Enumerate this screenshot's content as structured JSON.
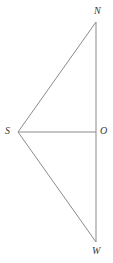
{
  "figure": {
    "background_color": "#ffffff",
    "stroke_color": "#8a8a8a",
    "label_color": "#3a3a3a",
    "stroke_width": 1,
    "width": 113,
    "height": 263,
    "points": {
      "N": {
        "label": "N",
        "x": 96,
        "y": 22
      },
      "S": {
        "label": "S",
        "x": 18,
        "y": 132
      },
      "O": {
        "label": "O",
        "x": 96,
        "y": 132
      },
      "W": {
        "label": "W",
        "x": 96,
        "y": 242
      }
    },
    "segments": [
      {
        "name": "segment-S-N",
        "from": "S",
        "to": "N"
      },
      {
        "name": "segment-N-O",
        "from": "N",
        "to": "O"
      },
      {
        "name": "segment-O-W",
        "from": "O",
        "to": "W"
      },
      {
        "name": "segment-W-S",
        "from": "W",
        "to": "S"
      },
      {
        "name": "segment-S-O",
        "from": "S",
        "to": "O"
      }
    ]
  }
}
